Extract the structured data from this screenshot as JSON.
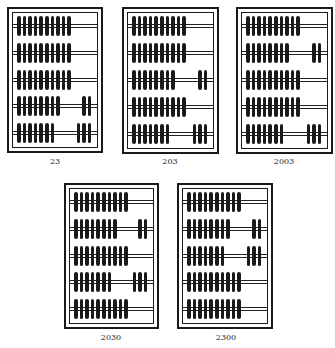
{
  "figure": {
    "bead_color": "#1a1a1a",
    "background": "#ffffff",
    "beads_per_rod": 10,
    "abaci": [
      {
        "label": "23",
        "frame": {
          "x": 7,
          "y": 7,
          "w": 96,
          "h": 146
        },
        "label_pos": {
          "x": 55,
          "y": 157
        },
        "rows_right_counts": [
          0,
          0,
          0,
          2,
          3
        ]
      },
      {
        "label": "203",
        "frame": {
          "x": 122,
          "y": 7,
          "w": 97,
          "h": 147
        },
        "label_pos": {
          "x": 170,
          "y": 157
        },
        "rows_right_counts": [
          0,
          0,
          2,
          0,
          3
        ]
      },
      {
        "label": "2003",
        "frame": {
          "x": 236,
          "y": 7,
          "w": 97,
          "h": 147
        },
        "label_pos": {
          "x": 284,
          "y": 157
        },
        "rows_right_counts": [
          0,
          2,
          0,
          0,
          3
        ]
      },
      {
        "label": "2030",
        "frame": {
          "x": 64,
          "y": 183,
          "w": 95,
          "h": 146
        },
        "label_pos": {
          "x": 111,
          "y": 333
        },
        "rows_right_counts": [
          0,
          2,
          0,
          3,
          0
        ]
      },
      {
        "label": "2300",
        "frame": {
          "x": 177,
          "y": 183,
          "w": 96,
          "h": 146
        },
        "label_pos": {
          "x": 226,
          "y": 333
        },
        "rows_right_counts": [
          0,
          2,
          3,
          0,
          0
        ]
      }
    ]
  }
}
